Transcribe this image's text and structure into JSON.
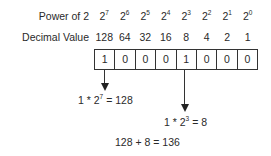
{
  "rows": {
    "power_label": "Power of 2",
    "decimal_label": "Decimal Value"
  },
  "columns": [
    {
      "base": "2",
      "exp": "7",
      "decimal": "128",
      "bit": "1"
    },
    {
      "base": "2",
      "exp": "6",
      "decimal": "64",
      "bit": "0"
    },
    {
      "base": "2",
      "exp": "5",
      "decimal": "32",
      "bit": "0"
    },
    {
      "base": "2",
      "exp": "4",
      "decimal": "16",
      "bit": "0"
    },
    {
      "base": "2",
      "exp": "3",
      "decimal": "8",
      "bit": "1"
    },
    {
      "base": "2",
      "exp": "2",
      "decimal": "4",
      "bit": "0"
    },
    {
      "base": "2",
      "exp": "1",
      "decimal": "2",
      "bit": "0"
    },
    {
      "base": "2",
      "exp": "0",
      "decimal": "1",
      "bit": "0"
    }
  ],
  "equations": {
    "eq1": {
      "prefix": "1 * 2",
      "exp": "7",
      "suffix": " = 128"
    },
    "eq2": {
      "prefix": "1 * 2",
      "exp": "3",
      "suffix": " = 8"
    },
    "total": "128 + 8 = 136"
  }
}
